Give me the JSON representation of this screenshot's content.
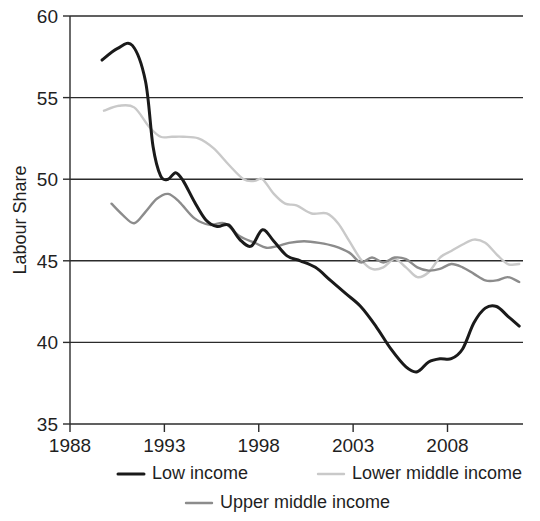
{
  "chart_data": {
    "type": "line",
    "title": "",
    "xlabel": "",
    "ylabel": "Labour Share",
    "xlim": [
      1988,
      2012
    ],
    "ylim": [
      35,
      60
    ],
    "xticks": [
      1988,
      1993,
      1998,
      2003,
      2008
    ],
    "yticks": [
      35,
      40,
      45,
      50,
      55,
      60
    ],
    "xtick_labels": [
      "1988",
      "1993",
      "1998",
      "2003",
      "2008"
    ],
    "ytick_labels": [
      "35",
      "40",
      "45",
      "50",
      "55",
      "60"
    ],
    "grid": true,
    "grid_axis": "y",
    "legend_position": "bottom",
    "series": [
      {
        "name": "Low income",
        "color": "#1a1a1a",
        "width": 3.0,
        "x": [
          1989.7,
          1990.5,
          1991.3,
          1992.0,
          1992.4,
          1992.8,
          1993.2,
          1993.6,
          1994.0,
          1994.6,
          1995.2,
          1995.8,
          1996.4,
          1997.0,
          1997.6,
          1998.2,
          1998.8,
          1999.5,
          2000.2,
          2001.0,
          2001.8,
          2002.6,
          2003.4,
          2004.2,
          2005.0,
          2005.8,
          2006.4,
          2007.0,
          2007.6,
          2008.2,
          2008.8,
          2009.4,
          2010.0,
          2010.6,
          2011.2,
          2011.8
        ],
        "values": [
          57.3,
          58.0,
          58.2,
          56.0,
          52.0,
          50.2,
          50.0,
          50.4,
          49.9,
          48.6,
          47.5,
          47.1,
          47.2,
          46.3,
          45.9,
          46.9,
          46.2,
          45.3,
          45.0,
          44.6,
          43.8,
          43.0,
          42.2,
          41.0,
          39.6,
          38.5,
          38.2,
          38.8,
          39.0,
          39.0,
          39.6,
          41.2,
          42.1,
          42.2,
          41.6,
          41.0
        ]
      },
      {
        "name": "Lower middle income",
        "color": "#c9c9c9",
        "width": 2.4,
        "x": [
          1989.8,
          1990.6,
          1991.4,
          1992.2,
          1992.8,
          1993.4,
          1994.0,
          1994.8,
          1995.6,
          1996.4,
          1997.2,
          1997.8,
          1998.2,
          1998.8,
          1999.4,
          2000.0,
          2000.8,
          2001.6,
          2002.2,
          2002.8,
          2003.4,
          2004.0,
          2004.6,
          2005.2,
          2005.8,
          2006.4,
          2007.0,
          2007.6,
          2008.2,
          2008.8,
          2009.4,
          2010.0,
          2010.6,
          2011.2,
          2011.8
        ],
        "values": [
          54.2,
          54.5,
          54.4,
          53.2,
          52.6,
          52.6,
          52.6,
          52.5,
          51.9,
          50.9,
          50.0,
          49.9,
          50.0,
          49.1,
          48.5,
          48.4,
          47.9,
          47.9,
          47.3,
          46.2,
          45.1,
          44.5,
          44.6,
          45.1,
          44.6,
          44.0,
          44.3,
          45.2,
          45.6,
          46.0,
          46.3,
          46.1,
          45.4,
          44.8,
          44.8
        ]
      },
      {
        "name": "Upper middle income",
        "color": "#8c8c8c",
        "width": 2.4,
        "x": [
          1990.2,
          1990.8,
          1991.4,
          1992.0,
          1992.6,
          1993.2,
          1993.8,
          1994.6,
          1995.4,
          1996.2,
          1997.0,
          1997.8,
          1998.4,
          1999.0,
          1999.6,
          2000.4,
          2001.2,
          2002.0,
          2002.8,
          2003.4,
          2004.0,
          2004.6,
          2005.2,
          2005.8,
          2006.4,
          2007.0,
          2007.6,
          2008.2,
          2008.8,
          2009.4,
          2010.0,
          2010.6,
          2011.2,
          2011.8
        ],
        "values": [
          48.5,
          47.8,
          47.3,
          48.0,
          48.8,
          49.1,
          48.6,
          47.6,
          47.2,
          47.3,
          46.5,
          46.1,
          45.8,
          45.9,
          46.1,
          46.2,
          46.1,
          45.9,
          45.5,
          44.9,
          45.2,
          44.9,
          45.2,
          45.1,
          44.6,
          44.4,
          44.5,
          44.8,
          44.6,
          44.2,
          43.8,
          43.8,
          44.0,
          43.7
        ]
      }
    ]
  },
  "legend": {
    "items": [
      {
        "label": "Low income",
        "color": "#1a1a1a"
      },
      {
        "label": "Lower middle income",
        "color": "#c9c9c9"
      },
      {
        "label": "Upper middle income",
        "color": "#8c8c8c"
      }
    ]
  }
}
